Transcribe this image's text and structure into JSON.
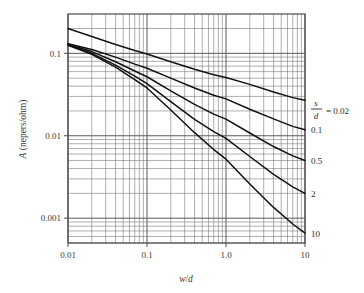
{
  "chart_data": {
    "type": "line",
    "title": "",
    "xlabel": "w/d",
    "ylabel": "A (nepers/ohm)",
    "xscale": "log",
    "yscale": "log",
    "xlim": [
      0.01,
      10
    ],
    "ylim": [
      0.0005,
      0.3
    ],
    "grid": true,
    "minor_grid": true,
    "legend_position": "right",
    "xticks": [
      "0.01",
      "0.1",
      "1.0",
      "10"
    ],
    "xtick_values": [
      0.01,
      0.1,
      1.0,
      10
    ],
    "yticks": [
      "0.1",
      "0.01",
      "0.001"
    ],
    "ytick_values": [
      0.1,
      0.01,
      0.001
    ],
    "legend_prefix_num": "s",
    "legend_prefix_den": "d",
    "legend_eq": "= 0.02",
    "series": [
      {
        "name": "0.02",
        "label": "= 0.02",
        "x": [
          0.01,
          0.02,
          0.04,
          0.07,
          0.1,
          0.2,
          0.4,
          0.7,
          1.0,
          2.0,
          4.0,
          7.0,
          10.0
        ],
        "values": [
          0.2,
          0.16,
          0.128,
          0.108,
          0.098,
          0.079,
          0.064,
          0.055,
          0.051,
          0.042,
          0.034,
          0.029,
          0.027
        ]
      },
      {
        "name": "0.1",
        "label": "0.1",
        "x": [
          0.01,
          0.02,
          0.04,
          0.07,
          0.1,
          0.2,
          0.4,
          0.7,
          1.0,
          2.0,
          4.0,
          7.0,
          10.0
        ],
        "values": [
          0.131,
          0.111,
          0.09,
          0.074,
          0.066,
          0.05,
          0.038,
          0.031,
          0.028,
          0.021,
          0.016,
          0.013,
          0.0118
        ]
      },
      {
        "name": "0.5",
        "label": "0.5",
        "x": [
          0.01,
          0.02,
          0.04,
          0.07,
          0.1,
          0.2,
          0.4,
          0.7,
          1.0,
          2.0,
          4.0,
          7.0,
          10.0
        ],
        "values": [
          0.129,
          0.105,
          0.079,
          0.061,
          0.052,
          0.035,
          0.024,
          0.0183,
          0.0159,
          0.0108,
          0.0074,
          0.0057,
          0.005
        ]
      },
      {
        "name": "2",
        "label": "2",
        "x": [
          0.01,
          0.02,
          0.04,
          0.07,
          0.1,
          0.2,
          0.4,
          0.7,
          1.0,
          2.0,
          4.0,
          7.0,
          10.0
        ],
        "values": [
          0.127,
          0.1,
          0.072,
          0.053,
          0.043,
          0.026,
          0.0158,
          0.0112,
          0.0093,
          0.0056,
          0.0034,
          0.0024,
          0.002
        ]
      },
      {
        "name": "10",
        "label": "10",
        "x": [
          0.01,
          0.02,
          0.04,
          0.07,
          0.1,
          0.2,
          0.4,
          0.7,
          1.0,
          2.0,
          4.0,
          7.0,
          10.0
        ],
        "values": [
          0.125,
          0.097,
          0.068,
          0.048,
          0.038,
          0.0205,
          0.0109,
          0.0068,
          0.0052,
          0.0026,
          0.00135,
          0.00085,
          0.00066
        ]
      }
    ]
  },
  "style": {
    "grid_color": "#5a5a5a",
    "minor_grid_color": "#6e6e6e",
    "curve_color": "#111111",
    "frame_color": "#4a4a4a",
    "text_color": "#333333",
    "background": "#ffffff"
  }
}
